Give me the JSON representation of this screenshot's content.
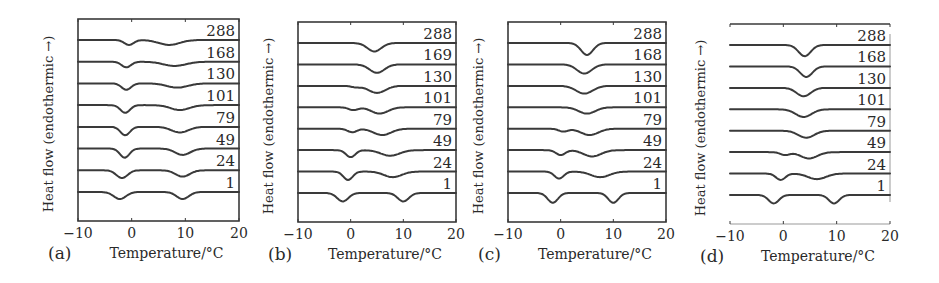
{
  "figure": {
    "y_axis_label": "Heat flow (endothermic →)",
    "x_axis_label": "Temperature/°C",
    "x_ticks": [
      "−10",
      "0",
      "10",
      "20"
    ]
  },
  "chart_data": [
    {
      "type": "line",
      "panel": "(a)",
      "title": "",
      "xlabel": "Temperature/°C",
      "ylabel": "Heat flow (endothermic →)",
      "xlim": [
        -10,
        20
      ],
      "x_ticks": [
        -10,
        0,
        10,
        20
      ],
      "grid": false,
      "curve_labels": [
        "288",
        "168",
        "130",
        "101",
        "79",
        "49",
        "24",
        "1"
      ],
      "series": [
        {
          "name": "288",
          "peaks": [
            {
              "T": -0.5,
              "depth": 0.35,
              "width": 1.0
            },
            {
              "T": 7.0,
              "depth": 0.35,
              "width": 2.2
            }
          ]
        },
        {
          "name": "168",
          "peaks": [
            {
              "T": -1.0,
              "depth": 0.4,
              "width": 1.0
            },
            {
              "T": 8.0,
              "depth": 0.3,
              "width": 2.4
            }
          ]
        },
        {
          "name": "130",
          "peaks": [
            {
              "T": -1.0,
              "depth": 0.45,
              "width": 1.0
            },
            {
              "T": 8.5,
              "depth": 0.3,
              "width": 2.2
            }
          ]
        },
        {
          "name": "101",
          "peaks": [
            {
              "T": -1.2,
              "depth": 0.55,
              "width": 1.0
            },
            {
              "T": 9.0,
              "depth": 0.35,
              "width": 2.0
            }
          ]
        },
        {
          "name": "79",
          "peaks": [
            {
              "T": -1.2,
              "depth": 0.6,
              "width": 1.0
            },
            {
              "T": 9.0,
              "depth": 0.4,
              "width": 1.8
            }
          ]
        },
        {
          "name": "49",
          "peaks": [
            {
              "T": -1.3,
              "depth": 0.65,
              "width": 1.0
            },
            {
              "T": 9.5,
              "depth": 0.45,
              "width": 1.6
            }
          ]
        },
        {
          "name": "24",
          "peaks": [
            {
              "T": -1.8,
              "depth": 0.55,
              "width": 1.2
            },
            {
              "T": 9.5,
              "depth": 0.45,
              "width": 1.5
            }
          ]
        },
        {
          "name": "1",
          "peaks": [
            {
              "T": -2.2,
              "depth": 0.5,
              "width": 1.3
            },
            {
              "T": 9.5,
              "depth": 0.5,
              "width": 1.3
            }
          ]
        }
      ]
    },
    {
      "type": "line",
      "panel": "(b)",
      "title": "",
      "xlabel": "Temperature/°C",
      "ylabel": "Heat flow (endothermic →)",
      "xlim": [
        -10,
        20
      ],
      "x_ticks": [
        -10,
        0,
        10,
        20
      ],
      "grid": false,
      "curve_labels": [
        "288",
        "169",
        "130",
        "101",
        "79",
        "49",
        "24",
        "1"
      ],
      "series": [
        {
          "name": "288",
          "peaks": [
            {
              "T": 4.5,
              "depth": 0.6,
              "width": 1.5
            }
          ]
        },
        {
          "name": "169",
          "peaks": [
            {
              "T": 5.0,
              "depth": 0.6,
              "width": 1.6
            }
          ]
        },
        {
          "name": "130",
          "peaks": [
            {
              "T": 1.0,
              "depth": 0.1,
              "width": 1.0
            },
            {
              "T": 5.0,
              "depth": 0.5,
              "width": 1.8
            }
          ]
        },
        {
          "name": "101",
          "peaks": [
            {
              "T": 0.5,
              "depth": 0.2,
              "width": 1.0
            },
            {
              "T": 5.5,
              "depth": 0.45,
              "width": 1.8
            }
          ]
        },
        {
          "name": "79",
          "peaks": [
            {
              "T": 0.3,
              "depth": 0.25,
              "width": 1.0
            },
            {
              "T": 6.0,
              "depth": 0.45,
              "width": 1.9
            }
          ]
        },
        {
          "name": "49",
          "peaks": [
            {
              "T": 0.0,
              "depth": 0.5,
              "width": 1.0
            },
            {
              "T": 7.5,
              "depth": 0.4,
              "width": 2.0
            }
          ]
        },
        {
          "name": "24",
          "peaks": [
            {
              "T": -0.5,
              "depth": 0.6,
              "width": 1.0
            },
            {
              "T": 8.0,
              "depth": 0.4,
              "width": 1.9
            }
          ]
        },
        {
          "name": "1",
          "peaks": [
            {
              "T": -1.5,
              "depth": 0.6,
              "width": 1.2
            },
            {
              "T": 10.0,
              "depth": 0.6,
              "width": 1.2
            }
          ]
        }
      ]
    },
    {
      "type": "line",
      "panel": "(c)",
      "title": "",
      "xlabel": "Temperature/°C",
      "ylabel": "Heat flow (endothermic →)",
      "xlim": [
        -10,
        20
      ],
      "x_ticks": [
        -10,
        0,
        10,
        20
      ],
      "grid": false,
      "curve_labels": [
        "288",
        "168",
        "130",
        "101",
        "79",
        "49",
        "24",
        "1"
      ],
      "series": [
        {
          "name": "288",
          "peaks": [
            {
              "T": 5.0,
              "depth": 0.85,
              "width": 1.3
            }
          ]
        },
        {
          "name": "168",
          "peaks": [
            {
              "T": 4.5,
              "depth": 0.65,
              "width": 1.6
            }
          ]
        },
        {
          "name": "130",
          "peaks": [
            {
              "T": 4.5,
              "depth": 0.55,
              "width": 1.8
            }
          ]
        },
        {
          "name": "101",
          "peaks": [
            {
              "T": 5.0,
              "depth": 0.45,
              "width": 1.8
            }
          ]
        },
        {
          "name": "79",
          "peaks": [
            {
              "T": 0.5,
              "depth": 0.2,
              "width": 1.0
            },
            {
              "T": 5.5,
              "depth": 0.45,
              "width": 1.9
            }
          ]
        },
        {
          "name": "49",
          "peaks": [
            {
              "T": 0.0,
              "depth": 0.35,
              "width": 1.0
            },
            {
              "T": 6.0,
              "depth": 0.45,
              "width": 1.9
            }
          ]
        },
        {
          "name": "24",
          "peaks": [
            {
              "T": -0.3,
              "depth": 0.5,
              "width": 1.0
            },
            {
              "T": 7.5,
              "depth": 0.4,
              "width": 2.0
            }
          ]
        },
        {
          "name": "1",
          "peaks": [
            {
              "T": -1.5,
              "depth": 0.7,
              "width": 1.1
            },
            {
              "T": 10.0,
              "depth": 0.7,
              "width": 1.1
            }
          ]
        }
      ]
    },
    {
      "type": "line",
      "panel": "(d)",
      "title": "",
      "xlabel": "Temperature/°C",
      "ylabel": "Heat flow (endothermic →)",
      "xlim": [
        -10,
        20
      ],
      "x_ticks": [
        -10,
        0,
        10,
        20
      ],
      "grid": false,
      "curve_labels": [
        "288",
        "168",
        "130",
        "101",
        "79",
        "49",
        "24",
        "1"
      ],
      "series": [
        {
          "name": "288",
          "peaks": [
            {
              "T": 4.0,
              "depth": 0.8,
              "width": 1.3
            }
          ]
        },
        {
          "name": "168",
          "peaks": [
            {
              "T": 4.3,
              "depth": 0.75,
              "width": 1.3
            }
          ]
        },
        {
          "name": "130",
          "peaks": [
            {
              "T": 3.8,
              "depth": 0.6,
              "width": 1.5
            }
          ]
        },
        {
          "name": "101",
          "peaks": [
            {
              "T": 3.8,
              "depth": 0.55,
              "width": 1.7
            }
          ]
        },
        {
          "name": "79",
          "peaks": [
            {
              "T": 4.3,
              "depth": 0.5,
              "width": 1.7
            }
          ]
        },
        {
          "name": "49",
          "peaks": [
            {
              "T": 0.3,
              "depth": 0.2,
              "width": 1.0
            },
            {
              "T": 4.8,
              "depth": 0.45,
              "width": 1.8
            }
          ]
        },
        {
          "name": "24",
          "peaks": [
            {
              "T": -0.5,
              "depth": 0.45,
              "width": 1.0
            },
            {
              "T": 6.3,
              "depth": 0.4,
              "width": 1.9
            }
          ]
        },
        {
          "name": "1",
          "peaks": [
            {
              "T": -1.8,
              "depth": 0.6,
              "width": 1.1
            },
            {
              "T": 9.5,
              "depth": 0.6,
              "width": 1.1
            }
          ]
        }
      ]
    }
  ],
  "panels_layout": [
    {
      "frame": [
        78,
        19,
        239,
        221
      ],
      "has_full_frame": true
    },
    {
      "frame": [
        298,
        22,
        456,
        222
      ],
      "has_full_frame": true
    },
    {
      "frame": [
        508,
        22,
        666,
        222
      ],
      "has_full_frame": true
    },
    {
      "frame": [
        730,
        24,
        890,
        224
      ],
      "has_full_frame": false
    }
  ]
}
